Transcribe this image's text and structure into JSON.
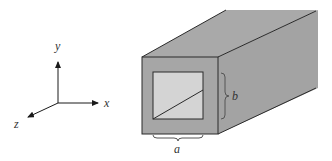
{
  "figure": {
    "axes": {
      "x_label": "x",
      "y_label": "y",
      "z_label": "z"
    },
    "dimensions": {
      "width_label": "a",
      "height_label": "b"
    },
    "colors": {
      "wall": "#a6a6a6",
      "wall_top": "#a9a9a9",
      "wall_side": "#a3a3a3",
      "interior": "#d4d4d4",
      "line": "#2a2a2a",
      "brace": "#555555"
    }
  }
}
